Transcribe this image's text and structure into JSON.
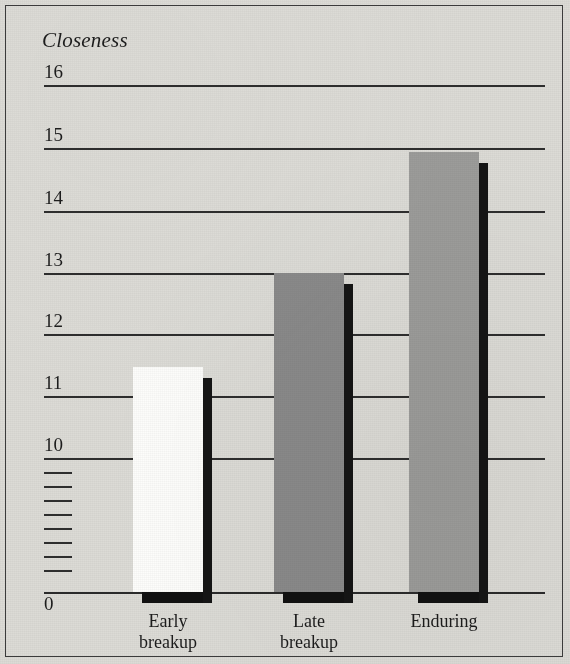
{
  "figure": {
    "background_color": "#dcdbd6",
    "frame_color": "#3b3b3b",
    "axis_color": "#2e2e2e"
  },
  "chart_data": {
    "type": "bar",
    "title": "Closeness",
    "xlabel": "",
    "ylabel": "Closeness",
    "categories": [
      "Early\nbreakup",
      "Late\nbreakup",
      "Enduring"
    ],
    "values": [
      11.4,
      12.95,
      14.95
    ],
    "ylim": [
      0,
      16
    ],
    "y_ticks": [
      0,
      10,
      11,
      12,
      13,
      14,
      15,
      16
    ],
    "y_tick_labels": [
      "0",
      "10",
      "11",
      "12",
      "13",
      "14",
      "15",
      "16"
    ],
    "axis_break": {
      "present": true,
      "between": [
        0,
        10
      ],
      "tick_count": 8
    },
    "grid": true,
    "grid_axis": "y",
    "legend": false,
    "bar_colors": [
      "#fdfdfb",
      "#8a8a8a",
      "#9c9c9a"
    ],
    "bar_shadow_color": "#151515",
    "series": [
      {
        "name": "Closeness",
        "values": [
          11.4,
          12.95,
          14.95
        ]
      }
    ]
  },
  "y_axis": [
    {
      "label": "16",
      "value": 16,
      "top": 85,
      "label_top": 62
    },
    {
      "label": "15",
      "value": 15,
      "top": 148,
      "label_top": 125
    },
    {
      "label": "14",
      "value": 14,
      "top": 211,
      "label_top": 188
    },
    {
      "label": "13",
      "value": 13,
      "top": 273,
      "label_top": 250
    },
    {
      "label": "12",
      "value": 12,
      "top": 334,
      "label_top": 311
    },
    {
      "label": "11",
      "value": 11,
      "top": 396,
      "label_top": 373
    },
    {
      "label": "10",
      "value": 10,
      "top": 458,
      "label_top": 435
    }
  ],
  "break_ticks": [
    472,
    486,
    500,
    514,
    528,
    542,
    556,
    570
  ],
  "baseline": {
    "label": "0",
    "top": 592,
    "label_top": 594
  },
  "bars": [
    {
      "category": "Early breakup",
      "label": "Early\nbreakup",
      "value": 11.4,
      "color": "#fdfdfb",
      "left": 133,
      "width": 70,
      "top": 367,
      "label_left": 108,
      "label_top": 611
    },
    {
      "category": "Late breakup",
      "label": "Late\nbreakup",
      "value": 12.95,
      "color": "#8a8a8a",
      "left": 274,
      "width": 70,
      "top": 273,
      "label_left": 249,
      "label_top": 611
    },
    {
      "category": "Enduring",
      "label": "Enduring",
      "value": 14.95,
      "color": "#9c9c9a",
      "left": 409,
      "width": 70,
      "top": 152,
      "label_left": 384,
      "label_top": 611
    }
  ]
}
